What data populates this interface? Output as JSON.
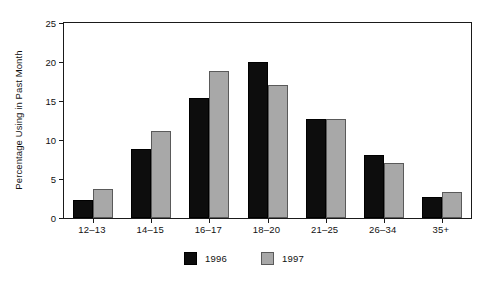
{
  "chart_data": {
    "type": "bar",
    "title": "",
    "subtitle": "",
    "xlabel": "",
    "ylabel": "Percentage Using in Past Month",
    "categories": [
      "12–13",
      "14–15",
      "16–17",
      "18–20",
      "21–25",
      "26–34",
      "35+"
    ],
    "series": [
      {
        "name": "1996",
        "color": "#0d0d0d",
        "values": [
          2.3,
          8.8,
          15.4,
          20.0,
          12.7,
          8.1,
          2.7
        ]
      },
      {
        "name": "1997",
        "color": "#a8a8a8",
        "values": [
          3.7,
          11.1,
          18.9,
          17.1,
          12.7,
          7.0,
          3.3
        ]
      }
    ],
    "ylim": [
      0,
      25
    ],
    "yticks": [
      0,
      5,
      10,
      15,
      20,
      25
    ],
    "ytick_labels": [
      "0",
      "5",
      "10",
      "15",
      "20",
      "25"
    ],
    "grid": false,
    "legend_position": "bottom-center",
    "frame": true
  },
  "legend": {
    "entries": [
      {
        "label": "1996",
        "swatch": "black-square-swatch"
      },
      {
        "label": "1997",
        "swatch": "gray-square-swatch"
      }
    ]
  }
}
